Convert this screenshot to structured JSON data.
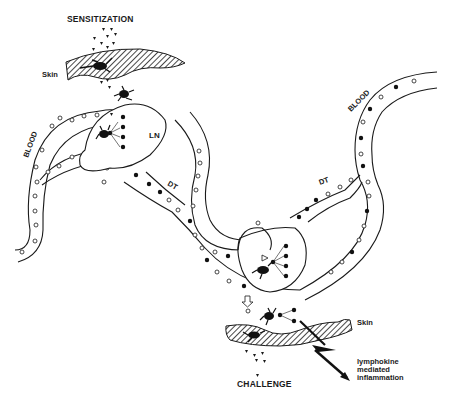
{
  "diagram": {
    "type": "immunology-schematic",
    "labels": {
      "sensitization": "SENSITIZATION",
      "challenge": "CHALLENGE",
      "skin_top": "Skin",
      "skin_bottom": "Skin",
      "lymph_node": "LN",
      "duct_left": "DT",
      "duct_right": "DT",
      "blood_left": "BLOOD",
      "blood_right": "BLOOD",
      "outcome_line1": "lymphokine",
      "outcome_line2": "mediated",
      "outcome_line3": "inflammation"
    },
    "legend_symbols": {
      "antigen": "small triangles",
      "langerhans_cell": "black dendritic cell",
      "sensitized_lymphocyte": "filled circle",
      "unsensitized_lymphocyte": "open circle"
    },
    "colors": {
      "ink": "#1a1a1a",
      "background": "#ffffff"
    }
  }
}
